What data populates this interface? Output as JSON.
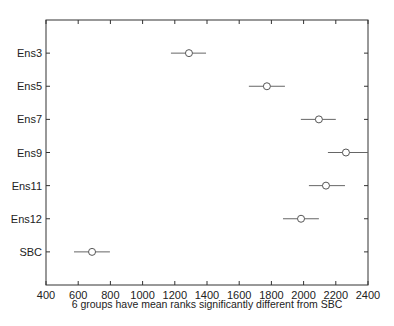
{
  "chart_data": {
    "type": "scatter",
    "subtype": "multiple-comparison-interval-plot",
    "title": "",
    "xlabel": "6 groups have mean ranks significantly different from SBC",
    "ylabel": "",
    "xlim": [
      400,
      2400
    ],
    "x_ticks": [
      400,
      600,
      800,
      1000,
      1200,
      1400,
      1600,
      1800,
      2000,
      2200,
      2400
    ],
    "categories": [
      "Ens3",
      "Ens5",
      "Ens7",
      "Ens9",
      "Ens11",
      "Ens12",
      "SBC"
    ],
    "series": [
      {
        "name": "mean rank",
        "values": [
          1288,
          1772,
          2095,
          2263,
          2139,
          1984,
          686
        ],
        "lower": [
          1176,
          1660,
          1983,
          2151,
          2033,
          1872,
          574
        ],
        "upper": [
          1394,
          1884,
          2200,
          2400,
          2257,
          2095,
          797
        ]
      }
    ],
    "grid": false,
    "legend": "none",
    "marker": "open-circle",
    "colors": {
      "axis": "#333333",
      "marker": "#555555",
      "interval": "#666666"
    }
  }
}
